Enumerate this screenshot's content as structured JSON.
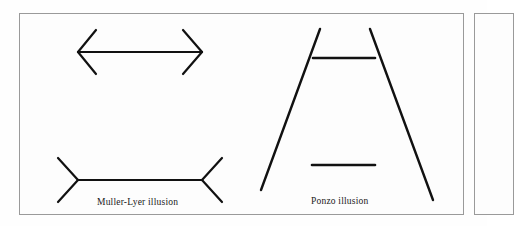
{
  "page": {
    "background_color": "#ffffff",
    "border_color": "#9a9a9a",
    "ink_color": "#111111",
    "width": 487,
    "height": 226
  },
  "figure": {
    "name": "optical-illusions-figure",
    "illusions": [
      {
        "id": "muller-lyer",
        "caption": "Muller-Lyer illusion",
        "description": "Two equal-length horizontal shafts; the upper one has outward-pointing arrowheads at both ends, the lower one has inward-pointing fins at both ends.",
        "parts": [
          {
            "name": "outward-arrow",
            "shaft": {
              "x1": 78,
              "y1": 52,
              "x2": 202,
              "y2": 52
            },
            "fins": [
              {
                "x1": 78,
                "y1": 52,
                "x2": 96,
                "y2": 30
              },
              {
                "x1": 78,
                "y1": 52,
                "x2": 96,
                "y2": 74
              },
              {
                "x1": 202,
                "y1": 52,
                "x2": 183,
                "y2": 30
              },
              {
                "x1": 202,
                "y1": 52,
                "x2": 183,
                "y2": 74
              }
            ]
          },
          {
            "name": "inward-arrow",
            "shaft": {
              "x1": 78,
              "y1": 180,
              "x2": 202,
              "y2": 180
            },
            "fins": [
              {
                "x1": 78,
                "y1": 180,
                "x2": 58,
                "y2": 158
              },
              {
                "x1": 78,
                "y1": 180,
                "x2": 58,
                "y2": 202
              },
              {
                "x1": 202,
                "y1": 180,
                "x2": 222,
                "y2": 158
              },
              {
                "x1": 202,
                "y1": 180,
                "x2": 222,
                "y2": 202
              }
            ]
          }
        ]
      },
      {
        "id": "ponzo",
        "caption": "Ponzo illusion",
        "description": "Two converging lines forming an inverted V frame, with two equal-length horizontal bars; the upper bar spans the narrow part and appears longer.",
        "parts": [
          {
            "name": "left-converging-line",
            "line": {
              "x1": 320,
              "y1": 29,
              "x2": 261,
              "y2": 190
            }
          },
          {
            "name": "right-converging-line",
            "line": {
              "x1": 370,
              "y1": 29,
              "x2": 433,
              "y2": 200
            }
          },
          {
            "name": "upper-horizontal-bar",
            "line": {
              "x1": 313,
              "y1": 58,
              "x2": 375,
              "y2": 58
            }
          },
          {
            "name": "lower-horizontal-bar",
            "line": {
              "x1": 312,
              "y1": 165,
              "x2": 375,
              "y2": 165
            }
          }
        ]
      }
    ]
  }
}
